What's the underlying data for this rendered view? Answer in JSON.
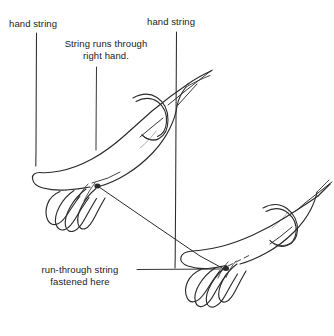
{
  "figure": {
    "ink_color": "#2b2b2b",
    "background_color": "#ffffff"
  },
  "labels": {
    "hand_string_left": "hand string",
    "hand_string_right": "hand string",
    "string_runs_through": "String runs through\nright hand.",
    "run_through_fastened": "run-through string\nfastened here"
  },
  "annotations": {
    "left_string_label": "hand string",
    "right_string_label": "hand string",
    "center_note": "String runs through right hand.",
    "bottom_note": "run-through string fastened here"
  },
  "elements": {
    "left_hand_string": "vertical string line at left",
    "right_hand_string": "vertical string line at right",
    "center_leader": "leader line from center note to right hand",
    "bottom_leader": "leader line from bottom caption to right hand knot",
    "run_through_string": "diagonal string from left hand knot to right hand knot",
    "left_wrist_loop": "string loop around left wrist",
    "right_wrist_loop": "string loop around right wrist",
    "left_knot_dot": "fastening point on left hand",
    "right_knot_dot": "fastening point on right hand",
    "left_arm": "left forearm and open hand",
    "right_arm": "right forearm and open hand"
  }
}
